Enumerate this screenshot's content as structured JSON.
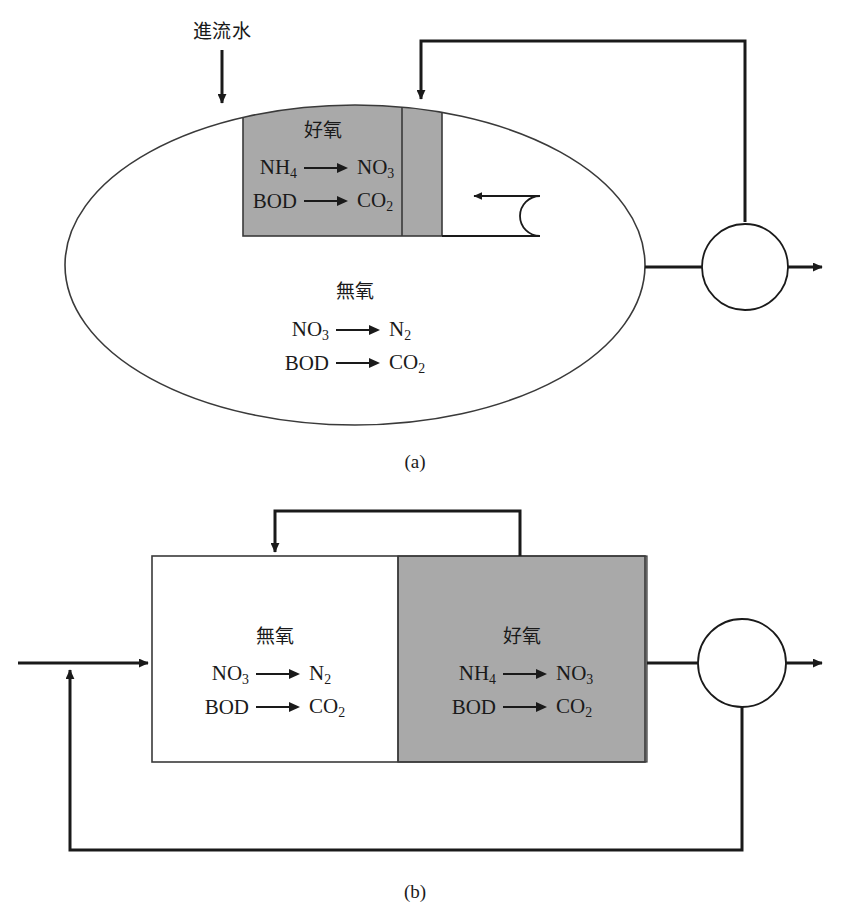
{
  "figure": {
    "colors": {
      "shaded_zone": "#a9a9a9",
      "line": "#1a1a1a",
      "thin_line": "#3a3a3a",
      "background": "#ffffff"
    },
    "panels": [
      {
        "id": "a",
        "caption": "(a)",
        "vessel_shape": "ellipse",
        "flows": {
          "influent_label": "進流水",
          "internal_recycle": "internal-recycle-loop",
          "return_sludge": "return-sludge-loop",
          "effluent": "effluent-arrow"
        },
        "zones": [
          {
            "name": "aerobic",
            "label": "好氧",
            "shaded": true,
            "reactions": [
              {
                "reactant": "NH",
                "reactant_sub": "4",
                "product": "NO",
                "product_sub": "3"
              },
              {
                "reactant": "BOD",
                "reactant_sub": "",
                "product": "CO",
                "product_sub": "2"
              }
            ]
          },
          {
            "name": "anoxic",
            "label": "無氧",
            "shaded": false,
            "reactions": [
              {
                "reactant": "NO",
                "reactant_sub": "3",
                "product": "N",
                "product_sub": "2"
              },
              {
                "reactant": "BOD",
                "reactant_sub": "",
                "product": "CO",
                "product_sub": "2"
              }
            ]
          }
        ]
      },
      {
        "id": "b",
        "caption": "(b)",
        "vessel_shape": "rectangle",
        "flows": {
          "influent_label": "",
          "internal_recycle": "internal-recycle-loop",
          "return_sludge": "return-sludge-loop",
          "effluent": "effluent-arrow"
        },
        "zones": [
          {
            "name": "anoxic",
            "label": "無氧",
            "shaded": false,
            "reactions": [
              {
                "reactant": "NO",
                "reactant_sub": "3",
                "product": "N",
                "product_sub": "2"
              },
              {
                "reactant": "BOD",
                "reactant_sub": "",
                "product": "CO",
                "product_sub": "2"
              }
            ]
          },
          {
            "name": "aerobic",
            "label": "好氧",
            "shaded": true,
            "reactions": [
              {
                "reactant": "NH",
                "reactant_sub": "4",
                "product": "NO",
                "product_sub": "3"
              },
              {
                "reactant": "BOD",
                "reactant_sub": "",
                "product": "CO",
                "product_sub": "2"
              }
            ]
          }
        ]
      }
    ]
  },
  "text": {
    "influent": "進流水",
    "aerobic": "好氧",
    "anoxic": "無氧",
    "caption_a": "(a)",
    "caption_b": "(b)",
    "nh4": "NH",
    "nh4_sub": "4",
    "no3": "NO",
    "no3_sub": "3",
    "n2": "N",
    "n2_sub": "2",
    "bod": "BOD",
    "co2": "CO",
    "co2_sub": "2"
  }
}
